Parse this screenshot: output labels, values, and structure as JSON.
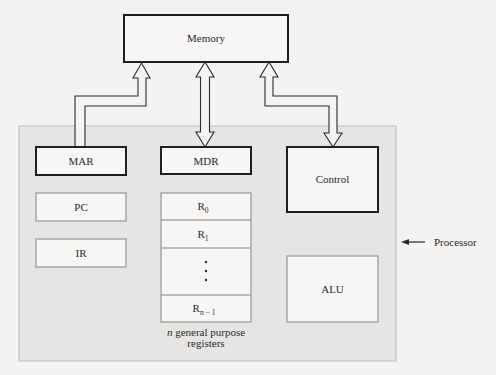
{
  "diagram": {
    "memory": {
      "label": "Memory"
    },
    "processor": {
      "label": "Processor",
      "fill": "#e6e5e3",
      "border": "#bdbcba"
    },
    "registers": {
      "mar": {
        "label": "MAR"
      },
      "mdr": {
        "label": "MDR"
      },
      "control": {
        "label": "Control"
      },
      "pc": {
        "label": "PC"
      },
      "ir": {
        "label": "IR"
      },
      "alu": {
        "label": "ALU"
      }
    },
    "register_file": {
      "rows": [
        {
          "main": "R",
          "sub": "0"
        },
        {
          "main": "R",
          "sub": "1"
        },
        {
          "main": "",
          "sub": "",
          "ellipsis": "⋮"
        },
        {
          "main": "R",
          "sub": "n − 1"
        }
      ],
      "caption_italic": "n",
      "caption_line1": " general purpose",
      "caption_line2": "registers"
    },
    "connections": [
      {
        "from": "MAR",
        "to": "Memory",
        "type": "unidirectional"
      },
      {
        "from": "MDR",
        "to": "Memory",
        "type": "bidirectional"
      },
      {
        "from": "Control",
        "to": "Memory",
        "type": "bidirectional"
      }
    ],
    "colors": {
      "dark_border": "#1e1e1e",
      "light_border": "#a8a7a5",
      "box_fill": "#f7f6f4",
      "background": "#f4f3f1"
    }
  }
}
